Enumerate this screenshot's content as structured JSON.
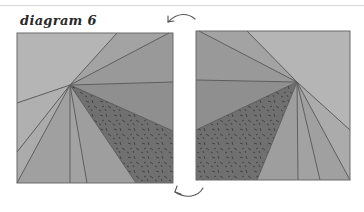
{
  "title": "diagram 6",
  "colors": {
    "background": "#ffffff",
    "outline": "#5a5a5a",
    "light": "#b4b4b4",
    "mid_light": "#a6a6a6",
    "mid": "#979797",
    "mid_dark": "#8a8a8a",
    "dark_textured": "#6e6e6e"
  },
  "panels": [
    {
      "name": "left-square",
      "label": "original block",
      "x": 17,
      "y": 33,
      "w": 156,
      "h": 150,
      "pivot": [
        70,
        85
      ]
    },
    {
      "name": "right-square",
      "label": "mirrored block",
      "x": 196,
      "y": 31,
      "w": 154,
      "h": 149,
      "pivot": [
        297,
        82
      ]
    }
  ],
  "arrows": [
    {
      "name": "top-curved-arrow",
      "direction": "pointing left",
      "icon": "curved-arrow-left"
    },
    {
      "name": "bottom-curved-arrow",
      "direction": "pointing left",
      "icon": "curved-arrow-left"
    }
  ]
}
